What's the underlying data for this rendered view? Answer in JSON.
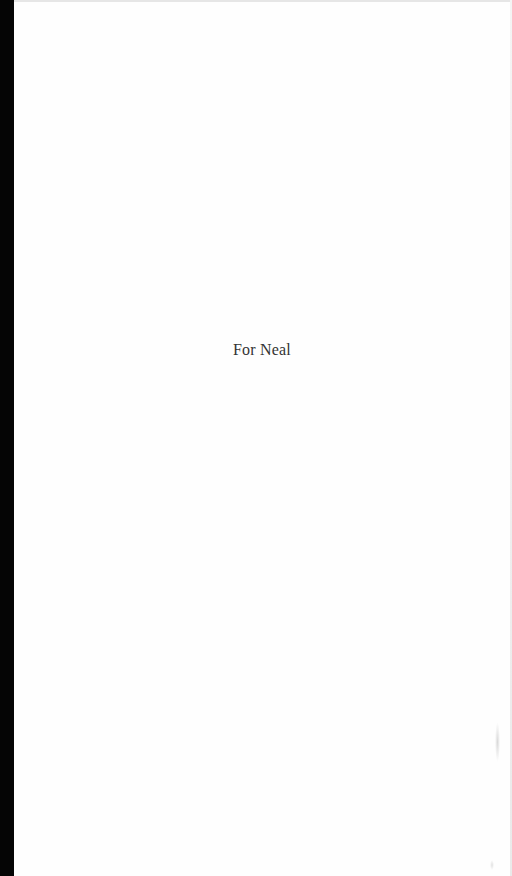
{
  "page": {
    "type": "dedication",
    "dedication_text": "For Neal"
  },
  "colors": {
    "page_background": "#fefefe",
    "text": "#333333",
    "scan_border": "#050505"
  }
}
